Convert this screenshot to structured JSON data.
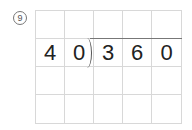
{
  "problem": {
    "number": "9",
    "label": "⑨"
  },
  "division": {
    "divisor": "40",
    "dividend": "360",
    "rows": [
      [
        "",
        "",
        "",
        "",
        ""
      ],
      [
        "4",
        "0",
        "3",
        "6",
        "0"
      ],
      [
        "",
        "",
        "",
        "",
        ""
      ],
      [
        "",
        "",
        "",
        "",
        ""
      ]
    ]
  }
}
